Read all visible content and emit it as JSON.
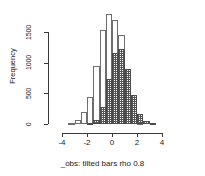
{
  "chart_data": {
    "type": "bar",
    "title": "",
    "subtitle": "",
    "xlabel": "_obs: tilted bars  rho 0.8",
    "ylabel": "Frequency",
    "xlim": [
      -4.6,
      4.2
    ],
    "ylim": [
      0,
      1800
    ],
    "xticks": [
      -4,
      -2,
      0,
      2,
      4
    ],
    "xtick_labels": [
      "-4",
      "-2",
      "0",
      "2",
      "4"
    ],
    "yticks": [
      0,
      500,
      1000,
      1500
    ],
    "ytick_labels": [
      "0",
      "500",
      "1000",
      "1500"
    ],
    "grid": false,
    "legend": null,
    "bin_width": 0.5,
    "series": [
      {
        "name": "hollow",
        "style": "open-white-bars",
        "bin_starts": [
          -3.5,
          -3.0,
          -2.5,
          -2.0,
          -1.5,
          -1.0,
          -0.5,
          0.0,
          0.5,
          1.0,
          1.5,
          2.0
        ],
        "values": [
          20,
          60,
          190,
          440,
          950,
          1540,
          1790,
          1700,
          1450,
          900,
          170,
          20
        ]
      },
      {
        "name": "tilted",
        "style": "cross-hatched-bars",
        "bin_starts": [
          -2.0,
          -1.5,
          -1.0,
          -0.5,
          0.0,
          0.5,
          1.0,
          1.5,
          2.0,
          2.5,
          3.0
        ],
        "values": [
          15,
          60,
          280,
          730,
          1160,
          1230,
          890,
          480,
          170,
          50,
          15
        ]
      }
    ]
  },
  "axes": {
    "y_title": "Frequency",
    "x_title": "_obs: tilted bars  rho 0.8"
  }
}
